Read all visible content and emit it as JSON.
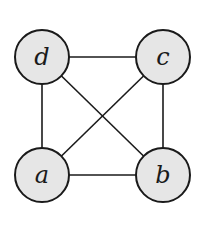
{
  "diagram": {
    "type": "graph",
    "node_fill": "#e6e6e6",
    "stroke": "#1a1a1a",
    "nodes": [
      {
        "id": "a",
        "label": "a",
        "x": 42,
        "y": 175
      },
      {
        "id": "b",
        "label": "b",
        "x": 163,
        "y": 175
      },
      {
        "id": "c",
        "label": "c",
        "x": 163,
        "y": 57
      },
      {
        "id": "d",
        "label": "d",
        "x": 42,
        "y": 57
      }
    ],
    "edges": [
      {
        "from": "d",
        "to": "c"
      },
      {
        "from": "d",
        "to": "a"
      },
      {
        "from": "c",
        "to": "b"
      },
      {
        "from": "a",
        "to": "b"
      },
      {
        "from": "d",
        "to": "b"
      },
      {
        "from": "a",
        "to": "c"
      }
    ]
  }
}
